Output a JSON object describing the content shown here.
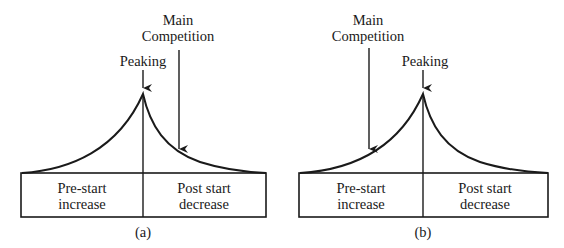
{
  "figure": {
    "panels": [
      {
        "id": "a",
        "caption": "(a)",
        "peak_label": "Peaking",
        "competition_label_line1": "Main",
        "competition_label_line2": "Competition",
        "competition_position": "after peak (post start decrease)",
        "left_box_line1": "Pre-start",
        "left_box_line2": "increase",
        "right_box_line1": "Post start",
        "right_box_line2": "decrease"
      },
      {
        "id": "b",
        "caption": "(b)",
        "peak_label": "Peaking",
        "competition_label_line1": "Main",
        "competition_label_line2": "Competition",
        "competition_position": "before peak (pre-start increase)",
        "left_box_line1": "Pre-start",
        "left_box_line2": "increase",
        "right_box_line1": "Post start",
        "right_box_line2": "decrease"
      }
    ],
    "line_color": "#1a1a1a",
    "background": "#ffffff"
  }
}
